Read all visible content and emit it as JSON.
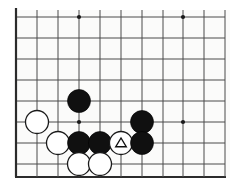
{
  "figure": {
    "kind": "go-board-diagram",
    "title": "",
    "caption": "",
    "background_color": "#ffffff",
    "board_color": "#fbfbfa",
    "line_color": "#4a4a4a",
    "edge_color": "#2b2b2b",
    "black_color": "#101010",
    "white_color": "#ffffff",
    "mark_color": "#111111"
  },
  "board": {
    "visible_columns": 11,
    "visible_rows": 8,
    "cell_size": 21,
    "origin_x": 16,
    "origin_y": 17,
    "left_edge_is_board_boundary": true,
    "bottom_edge_is_board_boundary": true,
    "top_edge_is_board_boundary": false,
    "right_edge_is_board_boundary": false,
    "bottom_edge_y": 177,
    "column_x": [
      16,
      37,
      58,
      79,
      100,
      121,
      142,
      163,
      183,
      204,
      225
    ],
    "row_y": [
      17,
      38,
      59,
      80,
      101,
      122,
      143,
      164
    ],
    "star_points": [
      {
        "name": "star-point-top-left",
        "col": 3,
        "row": 0
      },
      {
        "name": "star-point-top-right",
        "col": 8,
        "row": 0
      },
      {
        "name": "star-point-bottom-left",
        "col": 3,
        "row": 5
      },
      {
        "name": "star-point-bottom-right",
        "col": 8,
        "row": 5
      }
    ],
    "star_radius": 2.1
  },
  "stones": {
    "radius": 11.5,
    "items": [
      {
        "name": "stone-black-d-top",
        "color": "black",
        "col": 3,
        "row": 4,
        "mark": null
      },
      {
        "name": "stone-white-left",
        "color": "white",
        "col": 1,
        "row": 5,
        "mark": null
      },
      {
        "name": "stone-black-right-upper",
        "color": "black",
        "col": 6,
        "row": 5,
        "mark": null
      },
      {
        "name": "stone-white-row6-a",
        "color": "white",
        "col": 2,
        "row": 6,
        "mark": null
      },
      {
        "name": "stone-black-row6-a",
        "color": "black",
        "col": 3,
        "row": 6,
        "mark": null
      },
      {
        "name": "stone-black-row6-b",
        "color": "black",
        "col": 4,
        "row": 6,
        "mark": null
      },
      {
        "name": "stone-white-marked-triangle",
        "color": "white",
        "col": 5,
        "row": 6,
        "mark": "triangle"
      },
      {
        "name": "stone-black-row6-c",
        "color": "black",
        "col": 6,
        "row": 6,
        "mark": null
      },
      {
        "name": "stone-white-row7-a",
        "color": "white",
        "col": 3,
        "row": 7,
        "mark": null
      },
      {
        "name": "stone-white-row7-b",
        "color": "white",
        "col": 4,
        "row": 7,
        "mark": null
      }
    ]
  },
  "chart_data": {
    "type": "table",
    "xlabel": "",
    "ylabel": "",
    "columns": [
      "stone",
      "color",
      "column",
      "row",
      "mark"
    ],
    "rows": [
      [
        "stone-black-d-top",
        "black",
        3,
        4,
        ""
      ],
      [
        "stone-white-left",
        "white",
        1,
        5,
        ""
      ],
      [
        "stone-black-right-upper",
        "black",
        6,
        5,
        ""
      ],
      [
        "stone-white-row6-a",
        "white",
        2,
        6,
        ""
      ],
      [
        "stone-black-row6-a",
        "black",
        3,
        6,
        ""
      ],
      [
        "stone-black-row6-b",
        "black",
        4,
        6,
        ""
      ],
      [
        "stone-white-marked-triangle",
        "white",
        5,
        6,
        "triangle"
      ],
      [
        "stone-black-row6-c",
        "black",
        6,
        6,
        ""
      ],
      [
        "stone-white-row7-a",
        "white",
        3,
        7,
        ""
      ],
      [
        "stone-white-row7-b",
        "white",
        4,
        7,
        ""
      ]
    ],
    "counts": {
      "black": 5,
      "white": 5,
      "marked": 1
    }
  }
}
